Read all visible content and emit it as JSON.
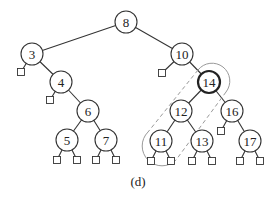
{
  "caption": "(d)",
  "tree": {
    "nodes": [
      {
        "id": "8",
        "x": 126,
        "y": 22
      },
      {
        "id": "3",
        "x": 32,
        "y": 54
      },
      {
        "id": "10",
        "x": 182,
        "y": 54
      },
      {
        "id": "4",
        "x": 61,
        "y": 82
      },
      {
        "id": "14",
        "x": 209,
        "y": 82,
        "highlighted": true
      },
      {
        "id": "6",
        "x": 88,
        "y": 111
      },
      {
        "id": "12",
        "x": 181,
        "y": 111
      },
      {
        "id": "16",
        "x": 232,
        "y": 111
      },
      {
        "id": "5",
        "x": 67,
        "y": 140
      },
      {
        "id": "7",
        "x": 106,
        "y": 140
      },
      {
        "id": "11",
        "x": 161,
        "y": 141
      },
      {
        "id": "13",
        "x": 202,
        "y": 141
      },
      {
        "id": "17",
        "x": 250,
        "y": 141
      }
    ],
    "edges": [
      [
        "8",
        "3"
      ],
      [
        "8",
        "10"
      ],
      [
        "3",
        "4"
      ],
      [
        "4",
        "6"
      ],
      [
        "6",
        "5"
      ],
      [
        "6",
        "7"
      ],
      [
        "10",
        "14"
      ],
      [
        "14",
        "12"
      ],
      [
        "14",
        "16"
      ],
      [
        "12",
        "11"
      ],
      [
        "12",
        "13"
      ],
      [
        "16",
        "17"
      ]
    ],
    "leaves": [
      {
        "parent": "3",
        "x": 21,
        "y": 72
      },
      {
        "parent": "4",
        "x": 50,
        "y": 100
      },
      {
        "parent": "10",
        "x": 162,
        "y": 73
      },
      {
        "parent": "5",
        "x": 57,
        "y": 160
      },
      {
        "parent": "5",
        "x": 77,
        "y": 160
      },
      {
        "parent": "7",
        "x": 96,
        "y": 160
      },
      {
        "parent": "7",
        "x": 116,
        "y": 160
      },
      {
        "parent": "11",
        "x": 151,
        "y": 161
      },
      {
        "parent": "11",
        "x": 171,
        "y": 161
      },
      {
        "parent": "13",
        "x": 192,
        "y": 161
      },
      {
        "parent": "13",
        "x": 212,
        "y": 161
      },
      {
        "parent": "16",
        "x": 221,
        "y": 131
      },
      {
        "parent": "17",
        "x": 240,
        "y": 161
      },
      {
        "parent": "17",
        "x": 260,
        "y": 161
      }
    ]
  }
}
